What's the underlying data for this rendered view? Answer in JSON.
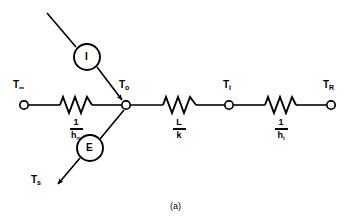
{
  "figure": {
    "caption": "(a)",
    "type": "thermal-resistance-network-diagram",
    "nodes": [
      {
        "id": "t-infinity",
        "label_main": "T",
        "label_sub": "∞",
        "x": 24,
        "y": 105
      },
      {
        "id": "t-zero",
        "label_main": "T",
        "label_sub": "o",
        "x": 126,
        "y": 105
      },
      {
        "id": "t-i",
        "label_main": "T",
        "label_sub": "i",
        "x": 229,
        "y": 105
      },
      {
        "id": "t-r",
        "label_main": "T",
        "label_sub": "R",
        "x": 331,
        "y": 105
      }
    ],
    "resistors": [
      {
        "id": "resistor-outer-convection",
        "numerator": "1",
        "denominator_main": "h",
        "denominator_sub": "∞",
        "x": 76,
        "y": 105
      },
      {
        "id": "resistor-conduction",
        "numerator": "L",
        "denominator_main": "k",
        "denominator_sub": "",
        "x": 179,
        "y": 105
      },
      {
        "id": "resistor-inner-convection",
        "numerator": "1",
        "denominator_main": "h",
        "denominator_sub": "i",
        "x": 281,
        "y": 105
      }
    ],
    "sources": [
      {
        "id": "current-source-I",
        "letter": "I",
        "cx": 87,
        "cy": 57,
        "r": 13
      },
      {
        "id": "source-E",
        "letter": "E",
        "cx": 90,
        "cy": 148,
        "r": 13
      }
    ],
    "terminal_labels": [
      {
        "id": "t-s",
        "label_main": "T",
        "label_sub": "s",
        "x": 38,
        "y": 181
      }
    ],
    "colors": {
      "stroke": "#000000",
      "background": "#ffffff"
    }
  }
}
